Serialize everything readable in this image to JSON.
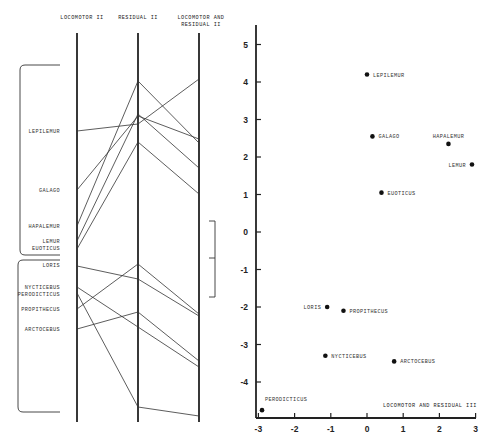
{
  "chart_data": [
    {
      "type": "parallel-coordinates",
      "axes": [
        "LOCOMOTOR II",
        "RESIDUAL II",
        "LOCOMOTOR AND RESIDUAL II"
      ],
      "headers": [
        {
          "lines": [
            "LOCOMOTOR II"
          ]
        },
        {
          "lines": [
            "RESIDUAL II"
          ]
        },
        {
          "lines": [
            "LOCOMOTOR AND",
            "RESIDUAL II"
          ]
        }
      ],
      "groups": [
        {
          "name": "group-1",
          "taxa": [
            {
              "label": "LEPILEMUR",
              "y": [
                131,
                124,
                79
              ]
            },
            {
              "label": "GALAGO",
              "y": [
                190,
                116,
                139
              ]
            },
            {
              "label": "HAPALEMUR",
              "y": [
                226,
                81,
                143
              ]
            },
            {
              "label": "LEMUR",
              "y": [
                241,
                114,
                168
              ]
            },
            {
              "label": "EUOTICUS",
              "y": [
                249,
                142,
                194
              ]
            }
          ]
        },
        {
          "name": "group-2",
          "taxa": [
            {
              "label": "LORIS",
              "y": [
                266,
                279,
                316
              ]
            },
            {
              "label": "NYCTICEBUS",
              "y": [
                287,
                327,
                367
              ]
            },
            {
              "label": "PERODICTICUS",
              "y": [
                293,
                407,
                416
              ]
            },
            {
              "label": "PROPITHECUS",
              "y": [
                309,
                264,
                314
              ]
            },
            {
              "label": "ARCTOCEBUS",
              "y": [
                329,
                312,
                361
              ]
            }
          ]
        }
      ],
      "left_labels": [
        {
          "text": "LEPILEMUR",
          "y": 133
        },
        {
          "text": "GALAGO",
          "y": 192
        },
        {
          "text": "HAPALEMUR",
          "y": 228
        },
        {
          "text": "LEMUR",
          "y": 243
        },
        {
          "text": "EUOTICUS",
          "y": 250
        },
        {
          "text": "LORIS",
          "y": 267
        },
        {
          "text": "NYCTICEBUS",
          "y": 289
        },
        {
          "text": "PERODICTICUS",
          "y": 296
        },
        {
          "text": "PROPITHECUS",
          "y": 311
        },
        {
          "text": "ARCTOCEBUS",
          "y": 331
        }
      ],
      "note": "y values are vertical positions along each axis (no numeric scale shown)"
    },
    {
      "type": "scatter",
      "title": "LOCOMOTOR AND RESIDUAL III",
      "xlabel": "",
      "ylabel": "",
      "xlim": [
        -3,
        3
      ],
      "ylim": [
        -5,
        5.5
      ],
      "xticks": [
        "-3",
        "-2",
        "-1",
        "0",
        "1",
        "2",
        "3"
      ],
      "yticks": [
        "5",
        "4",
        "3",
        "2",
        "1",
        "0",
        "-1",
        "-2",
        "-3",
        "-4"
      ],
      "grid": false,
      "points": [
        {
          "label": "LEPILEMUR",
          "x": 0.0,
          "y": 4.2,
          "label_pos": "right"
        },
        {
          "label": "GALAGO",
          "x": 0.15,
          "y": 2.55,
          "label_pos": "right"
        },
        {
          "label": "HAPALEMUR",
          "x": 2.25,
          "y": 2.35,
          "label_pos": "above"
        },
        {
          "label": "LEMUR",
          "x": 2.9,
          "y": 1.8,
          "label_pos": "left"
        },
        {
          "label": "EUOTICUS",
          "x": 0.4,
          "y": 1.05,
          "label_pos": "right"
        },
        {
          "label": "LORIS",
          "x": -1.1,
          "y": -2.0,
          "label_pos": "left"
        },
        {
          "label": "PROPITHECUS",
          "x": -0.65,
          "y": -2.1,
          "label_pos": "right"
        },
        {
          "label": "NYCTICEBUS",
          "x": -1.15,
          "y": -3.3,
          "label_pos": "right"
        },
        {
          "label": "ARCTOCEBUS",
          "x": 0.75,
          "y": -3.45,
          "label_pos": "right"
        },
        {
          "label": "PERODICTICUS",
          "x": -2.9,
          "y": -4.75,
          "label_pos": "above-right"
        }
      ]
    }
  ]
}
